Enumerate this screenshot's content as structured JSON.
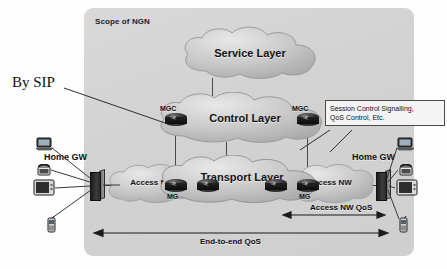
{
  "diagram": {
    "scope_label": "Scope of NGN",
    "annotation_by_sip": "By SIP",
    "clouds": {
      "service": "Service Layer",
      "control": "Control Layer",
      "transport": "Transport Layer",
      "access_left": "Access NW",
      "access_right": "Access NW"
    },
    "nodes": {
      "mgc_left": "MGC",
      "mgc_right": "MGC",
      "mg_left": "MG",
      "mg_right": "MG"
    },
    "gateways": {
      "left": "Home GW",
      "right": "Home GW"
    },
    "callout": {
      "line1": "Session Control Signalling,",
      "line2": "QoS Control, Etc."
    },
    "measures": {
      "end_to_end": "End-to-end QoS",
      "access_nw": "Access NW QoS"
    },
    "devices": {
      "laptop": "laptop-icon",
      "phone": "telephone-icon",
      "tv": "television-icon",
      "mobile": "mobile-phone-icon"
    },
    "colors": {
      "panel": "#d5d5d5",
      "cloud": "#c6c6c6",
      "line": "#3c3c3c",
      "node": "#1a1a1a"
    }
  }
}
